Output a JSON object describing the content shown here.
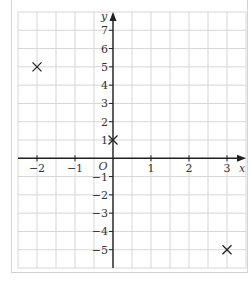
{
  "chart_data": {
    "type": "scatter",
    "title": "",
    "xlabel": "x",
    "ylabel": "y",
    "origin_label": "O",
    "xlim": [
      -2.5,
      3.5
    ],
    "ylim": [
      -6,
      8
    ],
    "grid": true,
    "x_ticks": [
      -2,
      -1,
      1,
      2,
      3
    ],
    "y_ticks": [
      -5,
      -4,
      -3,
      -2,
      -1,
      1,
      2,
      3,
      4,
      5,
      6,
      7
    ],
    "x_tick_labels": [
      "−2",
      "−1",
      "1",
      "2",
      "3"
    ],
    "y_tick_labels": [
      "−5",
      "−4",
      "−3",
      "−2",
      "−1",
      "1",
      "2",
      "3",
      "4",
      "5",
      "6",
      "7"
    ],
    "marker": "cross",
    "points": [
      {
        "x": -2,
        "y": 5
      },
      {
        "x": 0,
        "y": 1
      },
      {
        "x": 3,
        "y": -5
      }
    ]
  },
  "colors": {
    "grid": "#d6d6d6",
    "axis": "#222222",
    "marker": "#222222",
    "frame": "#d4d4d4"
  }
}
